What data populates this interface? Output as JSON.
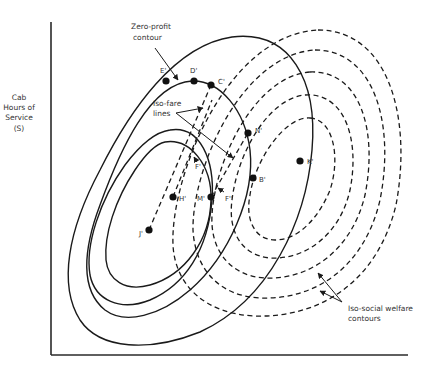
{
  "diagram": {
    "y_axis_label": [
      "Cab",
      "Hours of",
      "Service",
      "(S)"
    ],
    "annotations": {
      "zero_profit": [
        "Zero-profit",
        "contour"
      ],
      "iso_fare": [
        "Iso-fare",
        "lines"
      ],
      "iso_welfare": [
        "Iso-social welfare",
        "contours"
      ]
    },
    "points": [
      {
        "id": "E",
        "label": "E'",
        "x": 166,
        "y": 81
      },
      {
        "id": "D",
        "label": "D'",
        "x": 194,
        "y": 81
      },
      {
        "id": "C",
        "label": "C'",
        "x": 211,
        "y": 85
      },
      {
        "id": "N",
        "label": "N'",
        "x": 248,
        "y": 133
      },
      {
        "id": "K",
        "label": "K'",
        "x": 300,
        "y": 161
      },
      {
        "id": "B",
        "label": "B'",
        "x": 253,
        "y": 178
      },
      {
        "id": "M",
        "label": "M'",
        "x": 211,
        "y": 197
      },
      {
        "id": "H",
        "label": "H'",
        "x": 173,
        "y": 197
      },
      {
        "id": "J",
        "label": "J'",
        "x": 149,
        "y": 230
      }
    ],
    "small_labels": [
      {
        "id": "F1",
        "label": "F'"
      },
      {
        "id": "F2",
        "label": "F''"
      }
    ],
    "colors": {
      "line": "#1a1a1a",
      "background": "#ffffff",
      "text": "#333333"
    }
  }
}
